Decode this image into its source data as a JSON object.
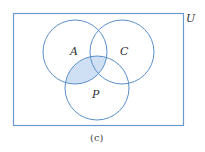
{
  "diagram": {
    "type": "venn",
    "universe_label": "U",
    "sets": [
      {
        "label": "A",
        "cx": 75,
        "cy": 52,
        "r": 32
      },
      {
        "label": "C",
        "cx": 122,
        "cy": 52,
        "r": 32
      },
      {
        "label": "P",
        "cx": 97,
        "cy": 88,
        "r": 32
      }
    ],
    "shaded_region": "A ∩ P",
    "caption": "(c)",
    "colors": {
      "stroke": "#5b8fc9",
      "fill": "#cfe0f5",
      "border": "#6a9bd1"
    }
  }
}
